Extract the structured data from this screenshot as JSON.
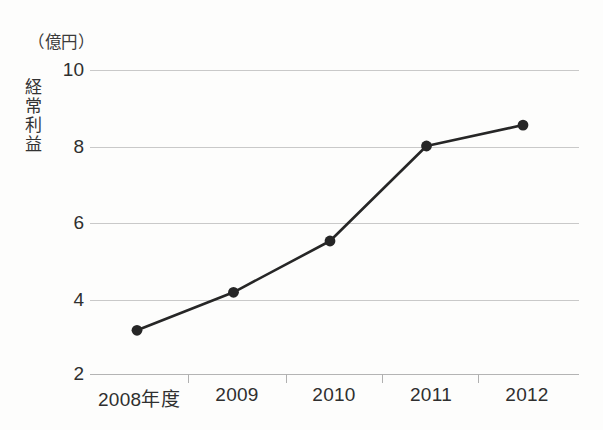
{
  "chart_data": {
    "type": "line",
    "title": "",
    "xlabel": "",
    "ylabel": "経常利益",
    "unit_label": "（億円）",
    "categories": [
      "2008年度",
      "2009",
      "2010",
      "2011",
      "2012"
    ],
    "values": [
      3.15,
      4.15,
      5.5,
      8.0,
      8.55
    ],
    "series": [
      {
        "name": "経常利益",
        "values": [
          3.15,
          4.15,
          5.5,
          8.0,
          8.55
        ]
      }
    ],
    "ylim": [
      2,
      10
    ],
    "yticks": [
      2,
      4,
      6,
      8,
      10
    ],
    "ytick_labels": [
      "2",
      "4",
      "6",
      "8",
      "10"
    ],
    "grid": true,
    "legend": "none",
    "marker": "filled-circle",
    "line_color": "#262626",
    "grid_color": "#c9c9c9",
    "background_color": "#fdfdfc",
    "text_color": "#2f2f2f"
  },
  "axis": {
    "y_title_chars": [
      "経",
      "常",
      "利",
      "益"
    ],
    "unit": "（億円）"
  }
}
